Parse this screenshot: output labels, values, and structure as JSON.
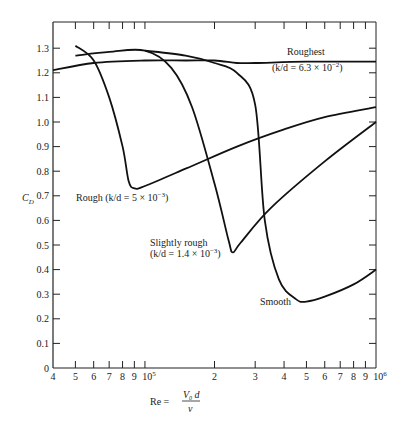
{
  "chart_data": {
    "type": "line",
    "title": "",
    "xlabel": "Re = V0 d / ν",
    "ylabel": "C_D",
    "xscale": "log",
    "xlim": [
      40000,
      1000000
    ],
    "ylim": [
      0,
      1.38
    ],
    "grid": false,
    "x_tick_labels": [
      "4",
      "5",
      "6",
      "7",
      "8",
      "9",
      "10^5",
      "2",
      "3",
      "4",
      "5",
      "6",
      "7",
      "8",
      "9",
      "10^6"
    ],
    "y_tick_labels": [
      "0",
      "0.1",
      "0.2",
      "0.3",
      "0.4",
      "0.5",
      "0.6",
      "0.7",
      "0.8",
      "0.9",
      "1.0",
      "1.1",
      "1.2",
      "1.3"
    ],
    "series": [
      {
        "name": "Roughest",
        "annotation": "(k/d = 6.3 × 10^-2)",
        "x": [
          40000,
          60000,
          100000,
          150000,
          200000,
          250000,
          300000,
          500000,
          1000000
        ],
        "y": [
          1.21,
          1.24,
          1.25,
          1.25,
          1.25,
          1.24,
          1.24,
          1.245,
          1.245
        ]
      },
      {
        "name": "Rough",
        "annotation": "(k/d = 5 × 10^-3)",
        "x": [
          50000,
          60000,
          70000,
          80000,
          85000,
          90000,
          100000,
          150000,
          250000,
          400000,
          600000,
          1000000
        ],
        "y": [
          1.31,
          1.25,
          1.1,
          0.9,
          0.76,
          0.73,
          0.74,
          0.81,
          0.9,
          0.97,
          1.02,
          1.06
        ]
      },
      {
        "name": "Slightly rough",
        "annotation": "(k/d = 1.4 × 10^-3)",
        "x": [
          50000,
          70000,
          100000,
          130000,
          160000,
          200000,
          230000,
          240000,
          260000,
          350000,
          600000,
          1000000
        ],
        "y": [
          1.27,
          1.285,
          1.29,
          1.22,
          1.06,
          0.75,
          0.52,
          0.47,
          0.51,
          0.65,
          0.84,
          1.0
        ]
      },
      {
        "name": "Smooth",
        "annotation": "",
        "x": [
          100000,
          150000,
          200000,
          250000,
          300000,
          330000,
          380000,
          450000,
          500000,
          600000,
          800000,
          1000000
        ],
        "y": [
          1.29,
          1.27,
          1.24,
          1.2,
          1.07,
          0.6,
          0.36,
          0.28,
          0.27,
          0.29,
          0.34,
          0.4
        ]
      }
    ],
    "legend": "inline labels on curves"
  },
  "labels": {
    "roughest_name": "Roughest",
    "roughest_kd": "(k/d = 6.3 × 10",
    "roughest_exp": "−2",
    "rough": "Rough (k/d = 5 × 10",
    "rough_exp": "−3",
    "slightly_rough_name": "Slightly rough",
    "slightly_rough_kd": "(k/d = 1.4 × 10",
    "slightly_rough_exp": "−3",
    "smooth": "Smooth",
    "ylabel": "C",
    "ylabel_sub": "D",
    "xlabel_re": "Re =",
    "xlabel_num": "V",
    "xlabel_num_sub": "0",
    "xlabel_num_d": " d",
    "xlabel_den": "ν"
  }
}
